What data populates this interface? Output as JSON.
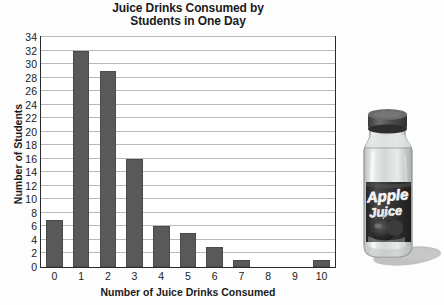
{
  "chart_data": {
    "type": "bar",
    "title": "Juice Drinks Consumed by Students in One Day",
    "title_line1": "Juice Drinks Consumed by",
    "title_line2": "Students in One Day",
    "xlabel": "Number of Juice Drinks Consumed",
    "ylabel": "Number of Students",
    "categories": [
      "0",
      "1",
      "2",
      "3",
      "4",
      "5",
      "6",
      "7",
      "8",
      "9",
      "10"
    ],
    "values": [
      7,
      32,
      29,
      16,
      6,
      5,
      3,
      1,
      0,
      0,
      1
    ],
    "ylim": [
      0,
      34
    ],
    "ytick_step": 2,
    "yticks": [
      "0",
      "2",
      "4",
      "6",
      "8",
      "10",
      "12",
      "14",
      "16",
      "18",
      "20",
      "22",
      "24",
      "26",
      "28",
      "30",
      "32",
      "34"
    ],
    "grid": "horizontal",
    "legend": "none",
    "bar_color": "#595959",
    "grid_color": "#b9b9b9",
    "frame_color": "#2a2a2a",
    "background_color": "#fdfdfd"
  },
  "illustration": {
    "name": "apple-juice-bottle",
    "label_line1": "Apple",
    "label_line2": "Juice",
    "cap_color": "#4f4f4f",
    "bottle_color": "#d8dada",
    "label_color": "#3a3a3a",
    "shadow_color": "#b0b0b0"
  }
}
